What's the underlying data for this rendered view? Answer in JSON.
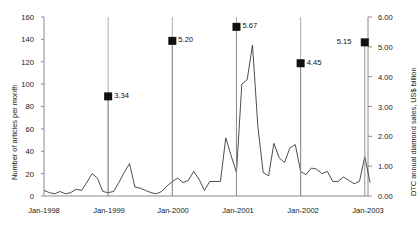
{
  "chart_data": {
    "type": "line",
    "title": "",
    "xlabel": "",
    "ylabel": "Number of articles per month",
    "ylabel_right": "DTC annual diamond sales, US$ billion",
    "ylim": [
      0,
      160
    ],
    "ylim_right": [
      0.0,
      6.0
    ],
    "grid": false,
    "legend": "none",
    "y_ticks": [
      "0",
      "20",
      "40",
      "60",
      "80",
      "100",
      "120",
      "140",
      "160"
    ],
    "y_ticks_right": [
      "0.00",
      "1.00",
      "2.00",
      "3.00",
      "4.00",
      "5.00",
      "6.00"
    ],
    "x_ticks": [
      "Jan-1998",
      "Jan-1999",
      "Jan-2000",
      "Jan-2001",
      "Jan-2002",
      "Jan-2003"
    ],
    "series": [
      {
        "name": "Number of articles per month",
        "style": "line",
        "x": [
          "Jan-1998",
          "Feb-1998",
          "Mar-1998",
          "Apr-1998",
          "May-1998",
          "Jun-1998",
          "Jul-1998",
          "Aug-1998",
          "Sep-1998",
          "Oct-1998",
          "Nov-1998",
          "Dec-1998",
          "Jan-1999",
          "Feb-1999",
          "Mar-1999",
          "Apr-1999",
          "May-1999",
          "Jun-1999",
          "Jul-1999",
          "Aug-1999",
          "Sep-1999",
          "Oct-1999",
          "Nov-1999",
          "Dec-1999",
          "Jan-2000",
          "Feb-2000",
          "Mar-2000",
          "Apr-2000",
          "May-2000",
          "Jun-2000",
          "Jul-2000",
          "Aug-2000",
          "Sep-2000",
          "Oct-2000",
          "Nov-2000",
          "Dec-2000",
          "Jan-2001",
          "Feb-2001",
          "Mar-2001",
          "Apr-2001",
          "May-2001",
          "Jun-2001",
          "Jul-2001",
          "Aug-2001",
          "Sep-2001",
          "Oct-2001",
          "Nov-2001",
          "Dec-2001",
          "Jan-2002",
          "Feb-2002",
          "Mar-2002",
          "Apr-2002",
          "May-2002",
          "Jun-2002",
          "Jul-2002",
          "Aug-2002",
          "Sep-2002",
          "Oct-2002",
          "Nov-2002",
          "Dec-2002",
          "Jan-2003",
          "Feb-2003"
        ],
        "values": [
          5,
          3,
          2,
          4,
          2,
          3,
          6,
          5,
          12,
          20,
          16,
          4,
          3,
          4,
          12,
          21,
          29,
          8,
          7,
          5,
          3,
          2,
          4,
          9,
          13,
          16,
          12,
          14,
          22,
          15,
          5,
          13,
          13,
          13,
          52,
          36,
          21,
          100,
          104,
          135,
          62,
          21,
          18,
          47,
          34,
          30,
          43,
          46,
          22,
          19,
          25,
          24,
          20,
          22,
          13,
          13,
          17,
          14,
          11,
          13,
          35,
          12
        ]
      },
      {
        "name": "DTC annual diamond sales, US$ billion",
        "style": "marker-with-droplines",
        "points": [
          {
            "x": "Jan-1999",
            "value": 3.34,
            "label": "3.34",
            "label_side": "right"
          },
          {
            "x": "Jan-2000",
            "value": 5.2,
            "label": "5.20",
            "label_side": "right"
          },
          {
            "x": "Jan-2001",
            "value": 5.67,
            "label": "5.67",
            "label_side": "right"
          },
          {
            "x": "Jan-2002",
            "value": 4.45,
            "label": "4.45",
            "label_side": "right"
          },
          {
            "x": "Jan-2003",
            "value": 5.15,
            "label": "5.15",
            "label_side": "left"
          }
        ]
      }
    ],
    "colors": {
      "line": "#3a3a3a",
      "marker": "#111111",
      "axis": "#8a8a8a",
      "text": "#1a1a1a",
      "background": "#ffffff"
    }
  }
}
